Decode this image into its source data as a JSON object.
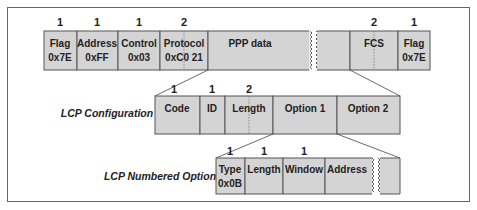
{
  "frame": {
    "border_color": "#666666",
    "box_fill": "#d4d4d4"
  },
  "ppp_frame": {
    "fields": [
      {
        "label": "Flag",
        "value": "0x7E",
        "size": "1"
      },
      {
        "label": "Address",
        "value": "0xFF",
        "size": "1"
      },
      {
        "label": "Control",
        "value": "0x03",
        "size": "1"
      },
      {
        "label": "Protocol",
        "value": "0xC0 21",
        "size": "2"
      },
      {
        "label": "PPP data",
        "value": "",
        "size": ""
      },
      {
        "label": "FCS",
        "value": "",
        "size": "2"
      },
      {
        "label": "Flag",
        "value": "0x7E",
        "size": "1"
      }
    ]
  },
  "lcp_configuration": {
    "caption": "LCP Configuration",
    "fields": [
      {
        "label": "Code",
        "size": "1"
      },
      {
        "label": "ID",
        "size": "1"
      },
      {
        "label": "Length",
        "size": "2"
      },
      {
        "label": "Option 1",
        "size": ""
      },
      {
        "label": "Option 2",
        "size": ""
      }
    ]
  },
  "lcp_numbered_option": {
    "caption": "LCP Numbered Option",
    "fields": [
      {
        "label": "Type",
        "value": "0x0B",
        "size": "1"
      },
      {
        "label": "Length",
        "size": "1"
      },
      {
        "label": "Window",
        "size": "1"
      },
      {
        "label": "Address",
        "size": ""
      }
    ]
  }
}
